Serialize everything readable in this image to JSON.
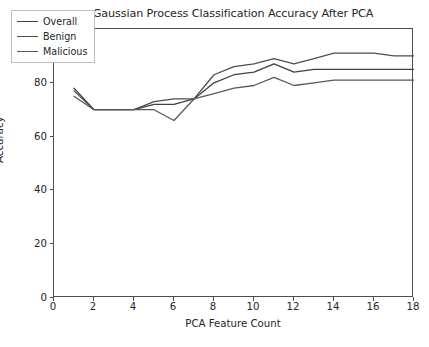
{
  "chart_data": {
    "type": "line",
    "title": "Gaussian Process Classification Accuracy After PCA",
    "xlabel": "PCA Feature Count",
    "ylabel": "Accuracy",
    "xlim": [
      0,
      18
    ],
    "ylim": [
      0,
      100
    ],
    "xticks": [
      0,
      2,
      4,
      6,
      8,
      10,
      12,
      14,
      16,
      18
    ],
    "yticks": [
      0,
      20,
      40,
      60,
      80,
      100
    ],
    "grid": false,
    "legend_position": "upper left",
    "x": [
      1,
      2,
      3,
      4,
      5,
      6,
      7,
      8,
      9,
      10,
      11,
      12,
      13,
      14,
      15,
      16,
      17,
      18
    ],
    "series": [
      {
        "name": "Overall",
        "color": "#404040",
        "values": [
          78,
          70,
          70,
          70,
          72,
          72,
          74,
          80,
          83,
          84,
          87,
          84,
          85,
          85,
          85,
          85,
          85,
          85
        ]
      },
      {
        "name": "Benign",
        "color": "#4d4d4d",
        "values": [
          77,
          70,
          70,
          70,
          73,
          74,
          74,
          83,
          86,
          87,
          89,
          87,
          89,
          91,
          91,
          91,
          90,
          90
        ]
      },
      {
        "name": "Malicious",
        "color": "#595959",
        "values": [
          75,
          70,
          70,
          70,
          70,
          66,
          74,
          76,
          78,
          79,
          82,
          79,
          80,
          81,
          81,
          81,
          81,
          81
        ]
      }
    ]
  },
  "legend": {
    "items": [
      {
        "label": "Overall"
      },
      {
        "label": "Benign"
      },
      {
        "label": "Malicious"
      }
    ]
  },
  "colors": {
    "axis": "#4d4d4d",
    "text": "#262626",
    "background": "#ffffff"
  }
}
